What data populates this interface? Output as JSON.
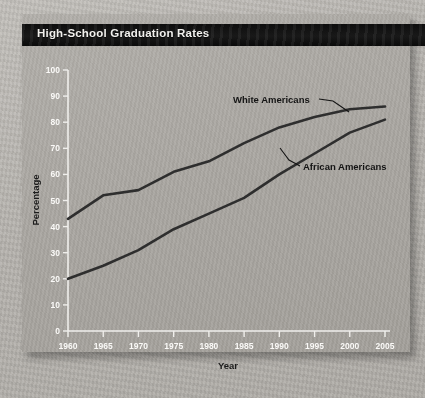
{
  "figure": {
    "title": "High-School Graduation Rates",
    "title_bar_color": "#101010",
    "title_text_color": "#f2f1ee",
    "panel_color": "#aaa7a2",
    "background_color": "#b9b6b1",
    "line_color": "#2e2e2e"
  },
  "chart_data": {
    "type": "line",
    "title": "High-School Graduation Rates",
    "xlabel": "Year",
    "ylabel": "Percentage",
    "x": [
      1960,
      1965,
      1970,
      1975,
      1980,
      1985,
      1990,
      1995,
      2000,
      2005
    ],
    "categories": [
      "1960",
      "1965",
      "1970",
      "1975",
      "1980",
      "1985",
      "1990",
      "1995",
      "2000",
      "2005"
    ],
    "xlim": [
      1960,
      2005
    ],
    "ylim": [
      0,
      100
    ],
    "ytick_labels": [
      "0",
      "10",
      "20",
      "30",
      "40",
      "50",
      "60",
      "70",
      "80",
      "90",
      "100"
    ],
    "yticks": [
      0,
      10,
      20,
      30,
      40,
      50,
      60,
      70,
      80,
      90,
      100
    ],
    "grid": false,
    "legend": "inline-annotations",
    "series": [
      {
        "name": "White Americans",
        "label": "White Americans",
        "values": [
          43,
          52,
          54,
          61,
          65,
          72,
          78,
          82,
          85,
          86
        ]
      },
      {
        "name": "African Americans",
        "label": "African Americans",
        "values": [
          20,
          25,
          31,
          39,
          45,
          51,
          60,
          68,
          76,
          81
        ]
      }
    ],
    "annotations": [
      {
        "text": "White Americans",
        "for_series": "White Americans"
      },
      {
        "text": "African Americans",
        "for_series": "African Americans"
      }
    ]
  }
}
